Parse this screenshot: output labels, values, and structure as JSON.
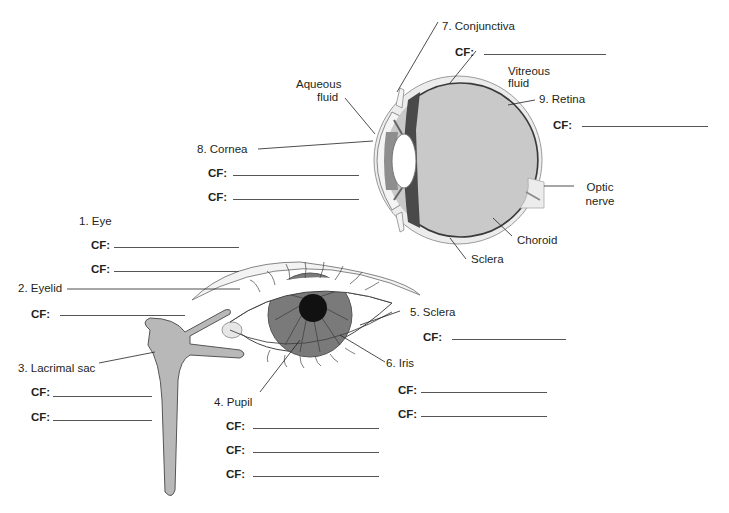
{
  "diagram": {
    "cf_prefix": "CF:",
    "numbered_labels": [
      {
        "id": "eye",
        "text": "1. Eye",
        "cf_blanks": 2
      },
      {
        "id": "eyelid",
        "text": "2. Eyelid",
        "cf_blanks": 1
      },
      {
        "id": "lacrimal_sac",
        "text": "3. Lacrimal sac",
        "cf_blanks": 2
      },
      {
        "id": "pupil",
        "text": "4. Pupil",
        "cf_blanks": 3
      },
      {
        "id": "sclera",
        "text": "5. Sclera",
        "cf_blanks": 1
      },
      {
        "id": "iris",
        "text": "6. Iris",
        "cf_blanks": 2
      },
      {
        "id": "conjunctiva",
        "text": "7. Conjunctiva",
        "cf_blanks": 1
      },
      {
        "id": "cornea",
        "text": "8. Cornea",
        "cf_blanks": 2
      },
      {
        "id": "retina",
        "text": "9. Retina",
        "cf_blanks": 1
      }
    ],
    "unnumbered_labels": {
      "aqueous_1": "Aqueous",
      "aqueous_2": "fluid",
      "vitreous_1": "Vitreous",
      "vitreous_2": "fluid",
      "optic_1": "Optic",
      "optic_2": "nerve",
      "choroid": "Choroid",
      "sclera_side": "Sclera"
    },
    "colors": {
      "vitreous": "#c9c9c9",
      "sclera_outer": "#ececec",
      "choroid_dark": "#4a4a4a",
      "iris": "#7a7a7a",
      "pupil": "#111111",
      "lacrimal": "#b8b8b8",
      "line": "#231f20"
    }
  }
}
